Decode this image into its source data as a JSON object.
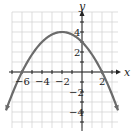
{
  "chart_data": {
    "type": "line",
    "title": "",
    "xlabel": "x",
    "ylabel": "y",
    "xlim": [
      -7,
      3.6
    ],
    "ylim": [
      -5.5,
      6
    ],
    "grid": true,
    "x_ticks": [
      -6,
      -4,
      -2,
      2
    ],
    "y_ticks": [
      4,
      2,
      -2,
      -4
    ],
    "x_tick_labels": [
      "-6",
      "-4",
      "-2",
      "2"
    ],
    "y_tick_labels": [
      "4",
      "2",
      "-2",
      "-4"
    ],
    "series": [
      {
        "name": "parabola",
        "equation": "y = -(1/4)(x + 2)^2 + 4",
        "vertex": [
          -2,
          4
        ],
        "x_intercepts": [
          -6,
          2
        ],
        "y_intercept": 3,
        "x": [
          -8,
          -7,
          -6,
          -5,
          -4,
          -3,
          -2,
          -1,
          0,
          1,
          2,
          3,
          4
        ],
        "values": [
          -5,
          -2.25,
          0,
          1.75,
          3,
          3.75,
          4,
          3.75,
          3,
          1.75,
          0,
          -2.25,
          -5
        ],
        "color": "#6b6b6b",
        "arrows_at_ends": true
      }
    ]
  },
  "labels": {
    "x_axis": "x",
    "y_axis": "y",
    "x_ticks": [
      "-6",
      "-4",
      "-2",
      "2"
    ],
    "y_ticks": [
      "4",
      "2",
      "-2",
      "-4"
    ]
  },
  "colors": {
    "grid": "#d0d0d0",
    "axis": "#222222",
    "curve": "#6b6b6b"
  }
}
